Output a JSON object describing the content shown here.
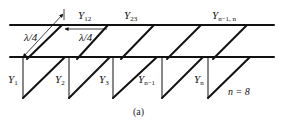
{
  "figure": {
    "caption": "(a)",
    "n_note": "n = 8",
    "colors": {
      "line": "#111111",
      "background": "#ffffff"
    }
  },
  "labels": {
    "quarter_wave_diag": "λ/4",
    "quarter_wave_horiz": "λ/4",
    "series": [
      {
        "sym": "Y",
        "sub": "12"
      },
      {
        "sym": "Y",
        "sub": "23"
      },
      {
        "sym": "Y",
        "sub": "n−1, n"
      }
    ],
    "shunt": [
      {
        "sym": "Y",
        "sub": "1"
      },
      {
        "sym": "Y",
        "sub": "2"
      },
      {
        "sym": "Y",
        "sub": "3"
      },
      {
        "sym": "Y",
        "sub": "n−1"
      },
      {
        "sym": "Y",
        "sub": "n"
      }
    ]
  },
  "geometry": {
    "top_line_y": 25,
    "bottom_line_y": 57,
    "line_x_start": 10,
    "line_x_end": 274,
    "stub_bottom_y": 98,
    "stub_vertical_x": [
      23,
      69,
      113,
      162,
      208
    ],
    "stub_diag_end_x": [
      65,
      110,
      157,
      203,
      250
    ],
    "link_bottom_x": [
      27,
      77,
      121,
      167,
      213
    ],
    "link_top_x": [
      62,
      108,
      154,
      201,
      247
    ]
  }
}
